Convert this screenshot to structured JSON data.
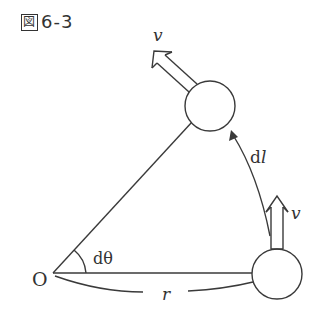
{
  "figure": {
    "label_prefix": "図",
    "label_number": "6-3"
  },
  "diagram": {
    "origin_label": "O",
    "angle_label": "dθ",
    "radius_label": "r",
    "arc_label_d": "d",
    "arc_label_l": "l",
    "velocity_top_label": "v",
    "velocity_bottom_label": "v",
    "stroke_color": "#3a3a3a"
  }
}
